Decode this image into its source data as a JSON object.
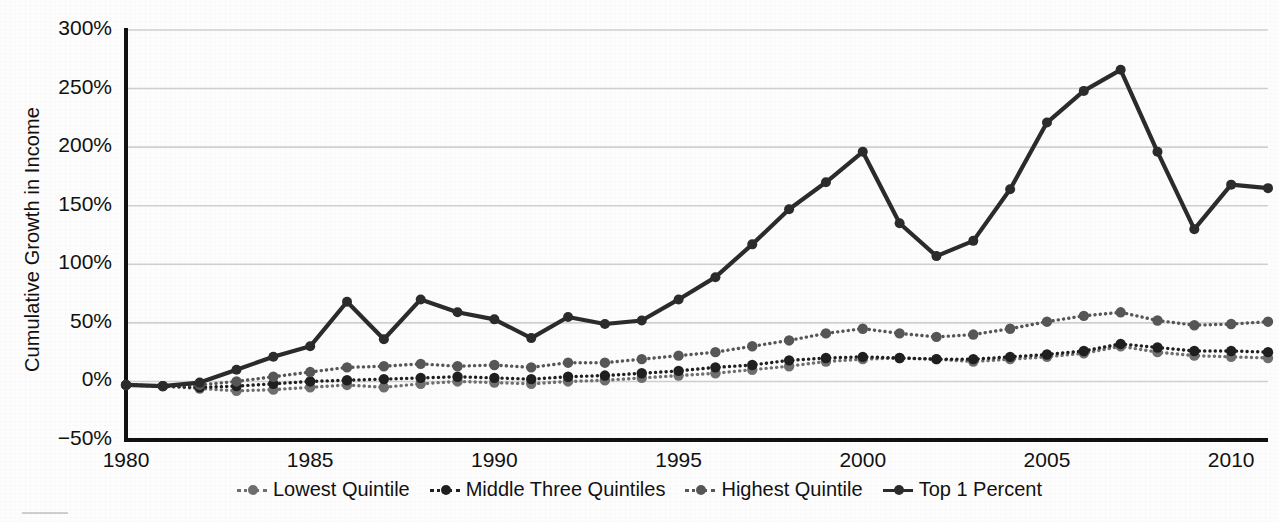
{
  "chart_data": {
    "type": "line",
    "title": "",
    "subtitle": "",
    "xlabel": "",
    "ylabel": "Cumulative Growth in Income",
    "xlim": [
      1980,
      2011
    ],
    "ylim": [
      -50,
      300
    ],
    "y_tick_labels": [
      "300%",
      "250%",
      "200%",
      "150%",
      "100%",
      "50%",
      "0%",
      "-50%"
    ],
    "y_tick_values": [
      300,
      250,
      200,
      150,
      100,
      50,
      0,
      -50
    ],
    "x_tick_labels": [
      "1980",
      "1985",
      "1990",
      "1995",
      "2000",
      "2005",
      "2010"
    ],
    "x_tick_values": [
      1980,
      1985,
      1990,
      1995,
      2000,
      2005,
      2010
    ],
    "grid": "horizontal",
    "legend_position": "bottom",
    "y_unit": "percent",
    "x": [
      1980,
      1981,
      1982,
      1983,
      1984,
      1985,
      1986,
      1987,
      1988,
      1989,
      1990,
      1991,
      1992,
      1993,
      1994,
      1995,
      1996,
      1997,
      1998,
      1999,
      2000,
      2001,
      2002,
      2003,
      2004,
      2005,
      2006,
      2007,
      2008,
      2009,
      2010,
      2011
    ],
    "series": [
      {
        "name": "Lowest Quintile",
        "color": "#6e6e6e",
        "linestyle": "dotted",
        "marker": "circle",
        "values": [
          -3,
          -4,
          -6,
          -8,
          -7,
          -5,
          -3,
          -5,
          -2,
          0,
          -1,
          -2,
          0,
          1,
          3,
          5,
          7,
          10,
          13,
          17,
          19,
          20,
          19,
          17,
          19,
          21,
          24,
          30,
          25,
          22,
          21,
          20
        ]
      },
      {
        "name": "Middle Three Quintiles",
        "color": "#1f1f1f",
        "linestyle": "dotted",
        "marker": "circle",
        "values": [
          -3,
          -4,
          -5,
          -4,
          -2,
          0,
          1,
          2,
          3,
          4,
          3,
          2,
          4,
          5,
          7,
          9,
          12,
          14,
          18,
          20,
          21,
          20,
          19,
          19,
          21,
          23,
          26,
          32,
          29,
          26,
          26,
          25
        ]
      },
      {
        "name": "Highest Quintile",
        "color": "#565656",
        "linestyle": "dotted",
        "marker": "circle",
        "values": [
          -3,
          -4,
          -3,
          0,
          4,
          8,
          12,
          13,
          15,
          13,
          14,
          12,
          16,
          16,
          19,
          22,
          25,
          30,
          35,
          41,
          45,
          41,
          38,
          40,
          45,
          51,
          56,
          59,
          52,
          48,
          49,
          51
        ]
      },
      {
        "name": "Top 1 Percent",
        "color": "#2b2b2b",
        "linestyle": "solid",
        "marker": "circle",
        "values": [
          -3,
          -4,
          -1,
          10,
          21,
          30,
          68,
          36,
          70,
          59,
          53,
          37,
          55,
          49,
          52,
          70,
          89,
          117,
          147,
          170,
          196,
          135,
          107,
          120,
          164,
          221,
          248,
          266,
          196,
          130,
          168,
          165
        ]
      }
    ]
  },
  "axis": {
    "ylabel": "Cumulative Growth in Income"
  },
  "legend": {
    "items": [
      {
        "label": "Lowest Quintile",
        "color": "#6e6e6e",
        "style": "dotted"
      },
      {
        "label": "Middle Three Quintiles",
        "color": "#1f1f1f",
        "style": "dotted"
      },
      {
        "label": "Highest Quintile",
        "color": "#565656",
        "style": "dotted"
      },
      {
        "label": "Top 1 Percent",
        "color": "#2b2b2b",
        "style": "solid"
      }
    ]
  },
  "colors": {
    "background": "#fdfdfd",
    "axis": "#111111",
    "grid": "#cfcfcf"
  }
}
